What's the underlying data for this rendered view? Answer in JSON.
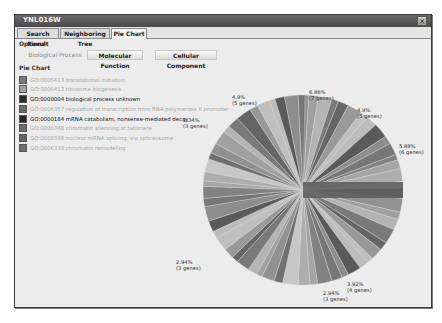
{
  "window": {
    "title": "YNL016W",
    "close_icon": "close-icon"
  },
  "tabs": [
    {
      "label": "Search Result",
      "active": false
    },
    {
      "label": "Neighboring Tree",
      "active": false
    },
    {
      "label": "Pie Chart",
      "active": true
    }
  ],
  "options": {
    "label": "Options",
    "items": [
      {
        "label": "Biological Process",
        "state": "selected-inactive"
      },
      {
        "label": "Molecular Function",
        "state": "button"
      },
      {
        "label": "Cellular Component",
        "state": "button"
      }
    ]
  },
  "pie_section": {
    "label": "Pie Chart"
  },
  "legend": [
    {
      "label": "GO:0006413 translational initiation",
      "color": "#7a7a7a",
      "dim": true
    },
    {
      "label": "GO:0006412 ribosome biogenesis",
      "color": "#a2a2a2",
      "dim": true
    },
    {
      "label": "GO:0000004 biological process unknown",
      "color": "#2a2a2a",
      "dim": false
    },
    {
      "label": "GO:0006357 regulation of transcription from RNA polymerase II promoter",
      "color": "#6a6a6a",
      "dim": true
    },
    {
      "label": "GO:0000184 mRNA catabolism, nonsense-mediated decay",
      "color": "#262626",
      "dim": false
    },
    {
      "label": "GO:0006348 chromatin silencing at telomere",
      "color": "#6c6c6c",
      "dim": true
    },
    {
      "label": "GO:0000398 nuclear mRNA splicing, via spliceosome",
      "color": "#626262",
      "dim": true
    },
    {
      "label": "GO:0006338 chromatin remodeling",
      "color": "#6e6e6e",
      "dim": true
    }
  ],
  "chart_data": {
    "type": "pie",
    "title": "Pie Chart",
    "note": "Many thin slices; only labeled slices are listed with visible values",
    "labeled_slices": [
      {
        "percent": "4.9%",
        "genes": "(5 genes)",
        "pos": [
          283,
          120
        ]
      },
      {
        "percent": "6.86%",
        "genes": "(7 genes)",
        "pos": [
          309,
          93
        ]
      },
      {
        "percent": "4.9%",
        "genes": "(5 genes)",
        "pos": [
          356,
          106
        ]
      },
      {
        "percent": "5.88%",
        "genes": "(6 genes)",
        "pos": [
          398,
          143
        ]
      },
      {
        "percent": "2.94%",
        "genes": "(3 genes)",
        "pos": [
          215,
          116
        ]
      },
      {
        "percent": "2.94%",
        "genes": "(3 genes)",
        "pos": [
          176,
          259
        ]
      },
      {
        "percent": "2.94%",
        "genes": "(3 genes)",
        "pos": [
          322,
          290
        ]
      },
      {
        "percent": "3.92%",
        "genes": "(4 genes)",
        "pos": [
          348,
          282
        ]
      }
    ],
    "labels": [
      {
        "text": "4.9%\n(5 genes)",
        "x": 232,
        "y": 94
      },
      {
        "text": "6.86%\n(7 genes)",
        "x": 309,
        "y": 89
      },
      {
        "text": "4.9%\n(5 genes)",
        "x": 357,
        "y": 107
      },
      {
        "text": "5.88%\n(6 genes)",
        "x": 399,
        "y": 143
      },
      {
        "text": "2.34%\n(3 genes)",
        "x": 183,
        "y": 117
      },
      {
        "text": "2.94%\n(3 genes)",
        "x": 176,
        "y": 259
      },
      {
        "text": "2.94%\n(3 genes)",
        "x": 323,
        "y": 290
      },
      {
        "text": "3.92%\n(4 genes)",
        "x": 347,
        "y": 281
      }
    ]
  }
}
